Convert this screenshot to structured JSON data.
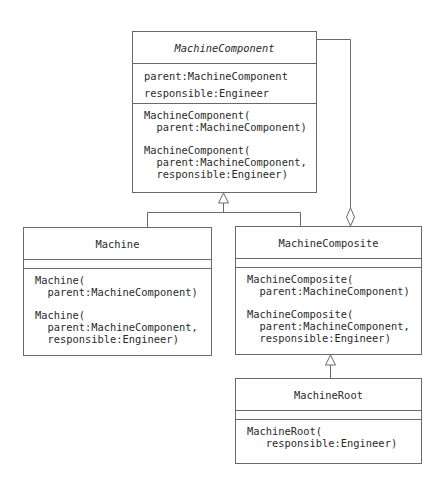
{
  "diagram": {
    "type": "UML class diagram",
    "classes": {
      "machine_component": {
        "name": "MachineComponent",
        "abstract": true,
        "attributes": [
          "parent:MachineComponent",
          "responsible:Engineer"
        ],
        "operations": [
          [
            "MachineComponent(",
            "  parent:MachineComponent)"
          ],
          [
            "MachineComponent(",
            "  parent:MachineComponent,",
            "  responsible:Engineer)"
          ]
        ]
      },
      "machine": {
        "name": "Machine",
        "attributes": [],
        "operations": [
          [
            "Machine(",
            "  parent:MachineComponent)"
          ],
          [
            "Machine(",
            "  parent:MachineComponent,",
            "  responsible:Engineer)"
          ]
        ]
      },
      "machine_composite": {
        "name": "MachineComposite",
        "attributes": [],
        "operations": [
          [
            "MachineComposite(",
            "  parent:MachineComponent)"
          ],
          [
            "MachineComposite(",
            "  parent:MachineComponent,",
            "  responsible:Engineer)"
          ]
        ]
      },
      "machine_root": {
        "name": "MachineRoot",
        "attributes": [],
        "operations": [
          [
            "MachineRoot(",
            "   responsible:Engineer)"
          ]
        ]
      }
    },
    "relationships": [
      {
        "type": "generalization",
        "from": "Machine",
        "to": "MachineComponent"
      },
      {
        "type": "generalization",
        "from": "MachineComposite",
        "to": "MachineComponent"
      },
      {
        "type": "generalization",
        "from": "MachineRoot",
        "to": "MachineComposite"
      },
      {
        "type": "aggregation",
        "whole": "MachineComposite",
        "part": "MachineComponent"
      }
    ],
    "colors": {
      "line": "#6a6a6a",
      "text": "#2a2a2a",
      "background": "#ffffff"
    }
  }
}
